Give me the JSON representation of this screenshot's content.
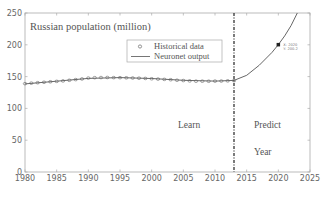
{
  "chart_data": {
    "type": "line",
    "title": "Russian population (million)",
    "xlabel": "Year",
    "ylabel": "",
    "xlim": [
      1980,
      2025
    ],
    "ylim": [
      0,
      250
    ],
    "xticks": [
      1980,
      1985,
      1990,
      1995,
      2000,
      2005,
      2010,
      2015,
      2020,
      2025
    ],
    "yticks": [
      0,
      50,
      100,
      150,
      200,
      250
    ],
    "grid": false,
    "legend_position": "upper-center",
    "series": [
      {
        "name": "Historical data",
        "marker": "circle",
        "x": [
          1980,
          1981,
          1982,
          1983,
          1984,
          1985,
          1986,
          1987,
          1988,
          1989,
          1990,
          1991,
          1992,
          1993,
          1994,
          1995,
          1996,
          1997,
          1998,
          1999,
          2000,
          2001,
          2002,
          2003,
          2004,
          2005,
          2006,
          2007,
          2008,
          2009,
          2010,
          2011,
          2012,
          2013
        ],
        "values": [
          138.9,
          139.7,
          140.4,
          141.1,
          141.9,
          142.5,
          143.2,
          144.2,
          145.3,
          146.3,
          147.7,
          148.3,
          148.5,
          148.6,
          148.4,
          148.3,
          148.1,
          147.8,
          147.5,
          147.1,
          146.6,
          146.1,
          145.6,
          145.1,
          144.3,
          143.8,
          143.2,
          142.8,
          142.8,
          142.7,
          142.9,
          143.0,
          143.3,
          143.6
        ]
      },
      {
        "name": "Neuronet output",
        "marker": "none",
        "x": [
          1980,
          1985,
          1990,
          1995,
          2000,
          2005,
          2010,
          2013,
          2015,
          2017,
          2019,
          2020,
          2021,
          2022,
          2023
        ],
        "values": [
          138.5,
          142.8,
          147.2,
          148.4,
          147.0,
          144.2,
          143.0,
          144.0,
          152,
          168,
          188,
          200.2,
          214,
          230,
          250
        ]
      }
    ],
    "annotations": [
      {
        "text": "Learn",
        "x": 2007.5,
        "y": 68
      },
      {
        "text": "Predict",
        "x": 2019,
        "y": 68
      },
      {
        "text": "Year",
        "x": 2019,
        "y": 42
      },
      {
        "type": "vline",
        "x": 2013,
        "style": "dash-dot"
      },
      {
        "type": "datatip",
        "x": 2020,
        "y": 200.2,
        "label_x": "X: 2020",
        "label_y": "Y: 200.2"
      }
    ]
  },
  "labels": {
    "title": "Russian population (million)",
    "legend_historical": "Historical data",
    "legend_neuronet": "Neuronet output",
    "learn": "Learn",
    "predict": "Predict",
    "year": "Year",
    "datatip_x": "X: 2020",
    "datatip_y": "Y: 200.2"
  }
}
